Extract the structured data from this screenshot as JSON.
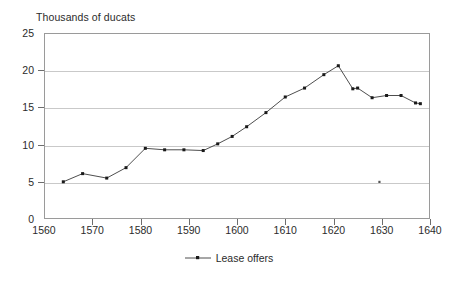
{
  "chart_data": {
    "type": "line",
    "title": "Thousands of ducats",
    "xlabel": "",
    "ylabel": "Thousands of ducats",
    "xlim": [
      1560,
      1640
    ],
    "ylim": [
      0,
      25
    ],
    "xticks": [
      1560,
      1570,
      1580,
      1590,
      1600,
      1610,
      1620,
      1630,
      1640
    ],
    "yticks": [
      0,
      5,
      10,
      15,
      20,
      25
    ],
    "grid": "horizontal",
    "legend_position": "bottom-center",
    "marker": "square",
    "line_color": "#3a3a3a",
    "marker_color": "#1a1a1a",
    "series": [
      {
        "name": "Lease offers",
        "x": [
          1564,
          1568,
          1573,
          1577,
          1581,
          1585,
          1589,
          1593,
          1596,
          1599,
          1602,
          1606,
          1610,
          1614,
          1618,
          1621,
          1624,
          1625,
          1628,
          1631,
          1634,
          1637,
          1638
        ],
        "values": [
          5.0,
          6.1,
          5.5,
          6.9,
          9.5,
          9.3,
          9.3,
          9.2,
          10.1,
          11.1,
          12.4,
          14.3,
          16.4,
          17.6,
          19.4,
          20.6,
          17.5,
          17.6,
          16.3,
          16.6,
          16.6,
          15.6,
          15.5
        ]
      }
    ],
    "annotations": [
      {
        "name": "stray-mark",
        "x": 1629.5,
        "y": 5.0
      }
    ]
  },
  "axis": {
    "title": "Thousands of ducats",
    "y_tick_labels": [
      "25",
      "20",
      "15",
      "10",
      "5",
      "0"
    ],
    "x_tick_labels": [
      "1560",
      "1570",
      "1580",
      "1590",
      "1600",
      "1610",
      "1620",
      "1630",
      "1640"
    ]
  },
  "legend": {
    "entries": [
      {
        "label": "Lease offers",
        "symbol": "line-with-square-marker"
      }
    ]
  }
}
